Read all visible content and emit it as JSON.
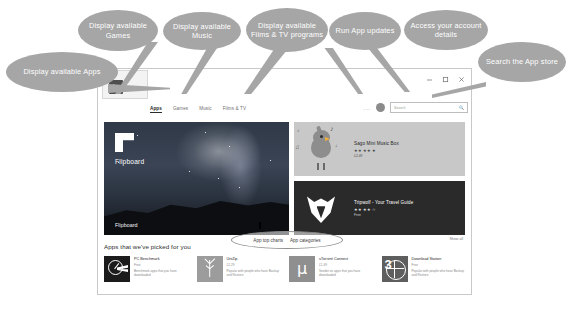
{
  "window": {
    "badge_title": "Store",
    "controls": {
      "minimize": "minimize-icon",
      "maximize": "maximize-icon",
      "close": "close-icon"
    },
    "nav_tabs": [
      {
        "label": "Apps",
        "active": true
      },
      {
        "label": "Games",
        "active": false
      },
      {
        "label": "Music",
        "active": false
      },
      {
        "label": "Films & TV",
        "active": false
      }
    ],
    "updates_button": "...",
    "account_avatar": "account-avatar-icon",
    "search": {
      "placeholder": "Search",
      "icon": "search-icon"
    }
  },
  "hero": {
    "logo": "flipboard-logo-icon",
    "title": "Flipboard",
    "subtitle": "Flipboard"
  },
  "promos": [
    {
      "name": "Sago Mini Music Box",
      "rating": "★★★★★",
      "price": "£2.49",
      "art": "bird-music-icon"
    },
    {
      "name": "Tripwolf - Your Travel Guide",
      "rating": "★★★★☆",
      "price": "Free",
      "art": "wolf-head-icon"
    }
  ],
  "highlight_oval": {
    "items": [
      "App top charts",
      "App categories"
    ]
  },
  "picked": {
    "title": "Apps that we've picked for you",
    "show_all": "Show all",
    "apps": [
      {
        "name": "PC Benchmark",
        "category": "Free",
        "description": "Benchmark apps that you have downloaded",
        "icon": "pc-benchmark-icon"
      },
      {
        "name": "UniZip",
        "category": "£2.29",
        "description": "Popular with people who have Backup and Restore",
        "icon": "unizip-icon"
      },
      {
        "name": "uTorrent Connect",
        "category": "£1.49",
        "description": "Seeder on apps that you have downloaded",
        "icon": "utorrent-icon"
      },
      {
        "name": "Download Station",
        "category": "Free",
        "description": "Popular with people who have Backup and Restore",
        "icon": "download-station-icon"
      }
    ]
  },
  "callouts": [
    {
      "id": "apps",
      "text": "Display available Apps"
    },
    {
      "id": "games",
      "text": "Display available Games"
    },
    {
      "id": "music",
      "text": "Display available Music"
    },
    {
      "id": "films",
      "text": "Display available Films & TV programs"
    },
    {
      "id": "updates",
      "text": "Run App updates"
    },
    {
      "id": "account",
      "text": "Access your account details"
    },
    {
      "id": "search",
      "text": "Search the App store"
    }
  ],
  "colors": {
    "callout_fill": "#a6a6a6",
    "callout_text": "#ffffff",
    "window_border": "#c9c9c9",
    "promo_music_bg": "#c8c8c8",
    "promo_travel_bg": "#2a2a2a"
  }
}
